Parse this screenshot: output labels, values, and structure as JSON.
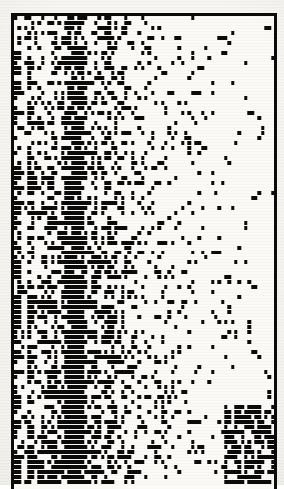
{
  "figure": {
    "kind": "binary-incidence-matrix",
    "background_color": "#f6f4f0",
    "cell_color": "#0b0b0b",
    "empty_color": "#fbfaf7",
    "frame_color": "#0b0b0b",
    "frame_border_width_px": 3,
    "frame": {
      "left": 11,
      "top": 13,
      "width": 266,
      "height": 476,
      "bottom_open": true
    },
    "plot": {
      "left": 14,
      "top": 16,
      "width": 260,
      "height": 469
    }
  },
  "chart_data": {
    "type": "heatmap",
    "title": "",
    "subtitle": "",
    "xlabel": "",
    "ylabel": "",
    "legend": [],
    "annotations": [],
    "grid": false,
    "value_labels": {
      "0": "absent (white)",
      "1": "present (black)"
    },
    "rows": 94,
    "cols": 78,
    "cell_width_px": 3.33,
    "cell_height_px": 4.99,
    "xlim": [
      0,
      78
    ],
    "ylim": [
      0,
      94
    ],
    "xticklabels": [],
    "yticklabels": [],
    "colorscale": [
      "#fbfaf7",
      "#0b0b0b"
    ],
    "column_fill_profile": [
      0.74,
      0.55,
      0.18,
      0.12,
      0.6,
      0.58,
      0.3,
      0.26,
      0.52,
      0.4,
      0.44,
      0.62,
      0.58,
      0.36,
      0.48,
      0.7,
      0.82,
      0.9,
      0.93,
      0.88,
      0.78,
      0.52,
      0.4,
      0.46,
      0.58,
      0.42,
      0.34,
      0.5,
      0.62,
      0.44,
      0.38,
      0.3,
      0.42,
      0.36,
      0.28,
      0.33,
      0.26,
      0.22,
      0.3,
      0.24,
      0.2,
      0.26,
      0.18,
      0.22,
      0.16,
      0.2,
      0.14,
      0.18,
      0.12,
      0.16,
      0.11,
      0.14,
      0.1,
      0.13,
      0.09,
      0.12,
      0.08,
      0.11,
      0.07,
      0.1,
      0.07,
      0.09,
      0.06,
      0.08,
      0.06,
      0.07,
      0.05,
      0.07,
      0.05,
      0.06,
      0.05,
      0.06,
      0.04,
      0.06,
      0.04,
      0.05,
      0.04,
      0.05
    ],
    "row_fill_profile_note": "row richness varies; lower rows (bottom) carry additional dense block at right columns",
    "dense_block": {
      "col_start": 63,
      "col_end": 77,
      "row_start": 78,
      "row_end": 93,
      "fill": 0.72,
      "note": "dark aggregated block in lower-right corner"
    },
    "near_solid_columns": [
      16,
      17,
      18,
      19,
      20
    ],
    "structure": "nested subset pattern: column occupancy decreases monotonically left to right"
  }
}
